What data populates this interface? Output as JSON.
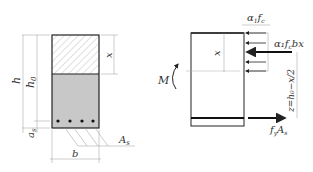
{
  "diagram": {
    "section": {
      "labels": {
        "h": "h",
        "h0": "h",
        "h0_sub": "0",
        "as": "a",
        "as_sub": "s",
        "x": "x",
        "b": "b",
        "As": "A",
        "As_sub": "s"
      },
      "bars_count": 4
    },
    "stress_diagram": {
      "labels": {
        "M": "M",
        "x": "x",
        "stress": "α",
        "stress_sub": "1",
        "stress_fc": "f",
        "stress_fc_sub": "c",
        "force_c": "α₁f",
        "force_c_sub": "c",
        "force_c_tail": "bx",
        "lever": "z=h₀−x/2",
        "force_t": "f",
        "force_t_sub": "y",
        "force_t_A": "A",
        "force_t_A_sub": "s"
      }
    },
    "colors": {
      "line": "#222222",
      "hatch": "#888888",
      "fill_tension": "#c8c8c8",
      "dim": "#999999"
    }
  }
}
